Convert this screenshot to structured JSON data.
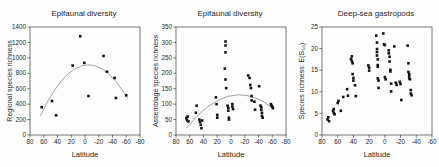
{
  "colors": {
    "background": "#fdfdfd",
    "point": "#141414",
    "trend_curve": "#8a8a8a",
    "axis": "#3d3d3d",
    "text": "#1f1f1f"
  },
  "chart_data": [
    {
      "type": "scatter",
      "title": "Epifaunal diversity",
      "xlabel": "Latitude",
      "ylabel": "Regional species richness",
      "xlim": [
        80,
        -80
      ],
      "ylim": [
        0,
        1400
      ],
      "xticks": [
        80,
        60,
        40,
        20,
        0,
        -20,
        -40,
        -60,
        -80
      ],
      "yticks": [
        0,
        200,
        400,
        600,
        800,
        1000,
        1200,
        1400
      ],
      "grid": false,
      "legend": false,
      "points": [
        [
          63,
          360
        ],
        [
          48,
          440
        ],
        [
          42,
          255
        ],
        [
          18,
          900
        ],
        [
          7,
          1280
        ],
        [
          1,
          935
        ],
        [
          -5,
          505
        ],
        [
          -27,
          1025
        ],
        [
          -32,
          820
        ],
        [
          -43,
          740
        ],
        [
          -45,
          480
        ],
        [
          -60,
          515
        ]
      ],
      "trend_curve": [
        [
          65,
          249
        ],
        [
          55,
          424
        ],
        [
          45,
          573
        ],
        [
          35,
          694
        ],
        [
          25,
          789
        ],
        [
          15,
          856
        ],
        [
          5,
          897
        ],
        [
          -5,
          910
        ],
        [
          -15,
          897
        ],
        [
          -25,
          856
        ],
        [
          -35,
          789
        ],
        [
          -45,
          694
        ],
        [
          -55,
          573
        ],
        [
          -62,
          471
        ]
      ]
    },
    {
      "type": "scatter",
      "title": "Epifaunal diversity",
      "xlabel": "Latitude",
      "ylabel": "Assemblage species richness",
      "xlim": [
        80,
        -80
      ],
      "ylim": [
        0,
        350
      ],
      "xticks": [
        80,
        60,
        40,
        20,
        0,
        -20,
        -40,
        -60,
        -80
      ],
      "yticks": [
        0,
        50,
        100,
        150,
        200,
        250,
        300,
        350
      ],
      "grid": false,
      "legend": false,
      "points": [
        [
          65,
          55
        ],
        [
          64,
          48
        ],
        [
          63,
          60
        ],
        [
          62,
          44
        ],
        [
          51,
          72
        ],
        [
          50,
          95
        ],
        [
          46,
          50
        ],
        [
          45,
          42
        ],
        [
          44,
          33
        ],
        [
          43,
          22
        ],
        [
          42,
          47
        ],
        [
          22,
          122
        ],
        [
          21,
          100
        ],
        [
          20,
          65
        ],
        [
          20,
          56
        ],
        [
          8,
          303
        ],
        [
          8,
          290
        ],
        [
          8,
          268
        ],
        [
          9,
          215
        ],
        [
          8,
          180
        ],
        [
          7,
          152
        ],
        [
          5,
          95
        ],
        [
          4,
          88
        ],
        [
          4,
          79
        ],
        [
          3,
          56
        ],
        [
          3,
          50
        ],
        [
          -2,
          100
        ],
        [
          -2,
          92
        ],
        [
          -3,
          84
        ],
        [
          -25,
          193
        ],
        [
          -27,
          185
        ],
        [
          -28,
          162
        ],
        [
          -29,
          152
        ],
        [
          -30,
          126
        ],
        [
          -30,
          112
        ],
        [
          -34,
          108
        ],
        [
          -35,
          82
        ],
        [
          -41,
          158
        ],
        [
          -43,
          95
        ],
        [
          -44,
          90
        ],
        [
          -44,
          82
        ],
        [
          -45,
          72
        ],
        [
          -45,
          62
        ],
        [
          -46,
          56
        ],
        [
          -58,
          100
        ],
        [
          -59,
          95
        ],
        [
          -60,
          92
        ],
        [
          -61,
          87
        ]
      ],
      "trend_curve": [
        [
          65,
          22
        ],
        [
          57,
          42
        ],
        [
          50,
          60
        ],
        [
          42,
          76
        ],
        [
          35,
          90
        ],
        [
          27,
          101
        ],
        [
          20,
          111
        ],
        [
          12,
          119
        ],
        [
          5,
          125
        ],
        [
          -3,
          128
        ],
        [
          -10,
          130
        ],
        [
          -18,
          129
        ],
        [
          -25,
          127
        ],
        [
          -33,
          122
        ],
        [
          -40,
          116
        ],
        [
          -48,
          107
        ],
        [
          -55,
          96
        ],
        [
          -62,
          85
        ]
      ]
    },
    {
      "type": "scatter",
      "title": "Deep-sea gastropods",
      "xlabel": "Latitude",
      "ylabel": "Species richness: E(S₅₀)",
      "xlim": [
        80,
        -60
      ],
      "ylim": [
        0,
        25
      ],
      "xticks": [
        80,
        60,
        40,
        20,
        0,
        -20,
        -40,
        -60
      ],
      "yticks": [
        0,
        5,
        10,
        15,
        20,
        25
      ],
      "grid": false,
      "legend": false,
      "points": [
        [
          73,
          3.6
        ],
        [
          72,
          4.1
        ],
        [
          71,
          3.2
        ],
        [
          66,
          5.6
        ],
        [
          65,
          5.1
        ],
        [
          65,
          6.0
        ],
        [
          64,
          4.8
        ],
        [
          60,
          7.4
        ],
        [
          59,
          7.9
        ],
        [
          56,
          5.6
        ],
        [
          53,
          8.8
        ],
        [
          48,
          10.6
        ],
        [
          47,
          9.1
        ],
        [
          43,
          17.6
        ],
        [
          42,
          18.2
        ],
        [
          42,
          17.1
        ],
        [
          41,
          16.6
        ],
        [
          41,
          14.1
        ],
        [
          40,
          13.2
        ],
        [
          40,
          12.6
        ],
        [
          38,
          11.5
        ],
        [
          37,
          9.0
        ],
        [
          21,
          16.1
        ],
        [
          20,
          15.6
        ],
        [
          20,
          14.9
        ],
        [
          11,
          23.0
        ],
        [
          10,
          21.4
        ],
        [
          10,
          19.9
        ],
        [
          10,
          19.2
        ],
        [
          10,
          18.4
        ],
        [
          9,
          17.5
        ],
        [
          9,
          16.2
        ],
        [
          9,
          15.8
        ],
        [
          9,
          13.1
        ],
        [
          8,
          12.6
        ],
        [
          8,
          10.9
        ],
        [
          2,
          23.5
        ],
        [
          1,
          21.0
        ],
        [
          0,
          20.8
        ],
        [
          0,
          13.4
        ],
        [
          -1,
          12.9
        ],
        [
          -5,
          19.6
        ],
        [
          -5,
          18.9
        ],
        [
          -6,
          18.1
        ],
        [
          -6,
          17.0
        ],
        [
          -7,
          15.1
        ],
        [
          -7,
          14.7
        ],
        [
          -8,
          11.9
        ],
        [
          -8,
          10.1
        ],
        [
          -12,
          20.5
        ],
        [
          -14,
          12.1
        ],
        [
          -15,
          11.6
        ],
        [
          -19,
          12.3
        ],
        [
          -20,
          11.8
        ],
        [
          -21,
          8.1
        ],
        [
          -29,
          20.7
        ],
        [
          -30,
          16.6
        ],
        [
          -30,
          14.6
        ],
        [
          -31,
          14.1
        ],
        [
          -31,
          13.6
        ],
        [
          -31,
          13.1
        ],
        [
          -32,
          12.9
        ],
        [
          -33,
          10.4
        ],
        [
          -33,
          9.6
        ],
        [
          -34,
          9.2
        ]
      ],
      "trend_curve": []
    }
  ]
}
